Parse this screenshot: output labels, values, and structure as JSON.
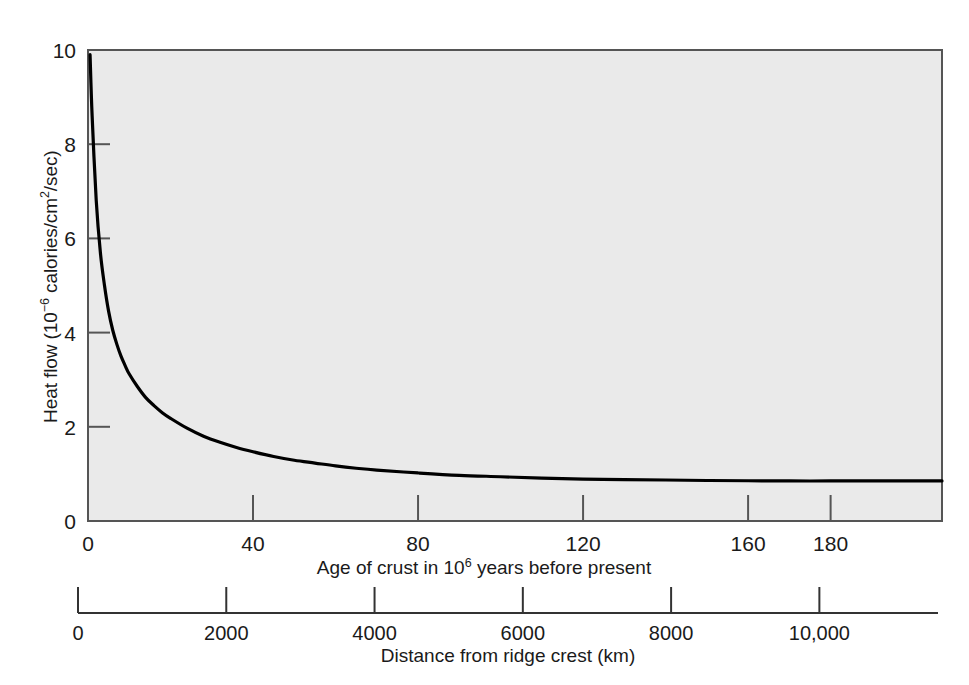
{
  "figure": {
    "background_color": "#ffffff",
    "plot_background_color": "#eaeaea",
    "line_color": "#000000",
    "axis_color": "#555555"
  },
  "chart_data": {
    "type": "line",
    "title": "",
    "xlabel": "Age of crust in 10⁶ years before present",
    "ylabel": "Heat flow (10⁻⁶ calories/cm²/sec)",
    "xlabel_html": "Age of crust in 10<sup>6</sup> years before present",
    "ylabel_html": "Heat flow (10<sup>−6</sup> calories/cm<sup>2</sup>/sec)",
    "xlim": [
      0,
      207
    ],
    "ylim": [
      0,
      10
    ],
    "grid": false,
    "legend": null,
    "x_ticks": [
      0,
      40,
      80,
      120,
      160,
      180
    ],
    "x_tick_labels": [
      "0",
      "40",
      "80",
      "120",
      "160",
      "180"
    ],
    "y_ticks": [
      0,
      2,
      4,
      6,
      8,
      10
    ],
    "y_tick_labels": [
      "0",
      "2",
      "4",
      "6",
      "8",
      "10"
    ],
    "secondary_axis": {
      "label": "Distance from ridge crest (km)",
      "ticks": [
        0,
        2000,
        4000,
        6000,
        8000,
        10000
      ],
      "tick_labels": [
        "0",
        "2000",
        "4000",
        "6000",
        "8000",
        "10,000"
      ],
      "lim": [
        0,
        11600
      ],
      "unit": "km"
    },
    "series": [
      {
        "name": "Heat flow vs age of crust",
        "x": [
          0.5,
          1,
          2,
          3,
          4,
          5,
          6,
          7,
          8,
          9,
          10,
          12,
          14,
          16,
          18,
          20,
          24,
          28,
          32,
          36,
          40,
          45,
          50,
          55,
          60,
          65,
          70,
          80,
          90,
          100,
          110,
          120,
          130,
          140,
          150,
          160,
          170,
          180,
          190,
          200,
          207
        ],
        "y": [
          9.9,
          8.6,
          6.8,
          5.7,
          5.0,
          4.45,
          4.05,
          3.75,
          3.5,
          3.3,
          3.12,
          2.85,
          2.62,
          2.45,
          2.3,
          2.18,
          1.97,
          1.8,
          1.67,
          1.56,
          1.47,
          1.37,
          1.29,
          1.23,
          1.17,
          1.12,
          1.08,
          1.02,
          0.97,
          0.94,
          0.91,
          0.89,
          0.88,
          0.87,
          0.86,
          0.855,
          0.85,
          0.85,
          0.85,
          0.85,
          0.85
        ]
      }
    ]
  }
}
